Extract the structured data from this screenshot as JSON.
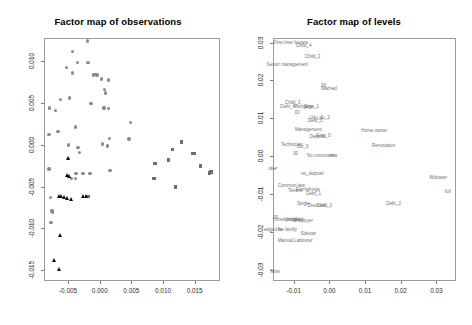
{
  "figure": {
    "background": "#ffffff",
    "panels": [
      {
        "id": "observations",
        "title": "Factor map of observations"
      },
      {
        "id": "levels",
        "title": "Factor map of levels"
      }
    ]
  },
  "chart_data": [
    {
      "type": "scatter",
      "title": "Factor map of observations",
      "xlabel": "",
      "ylabel": "",
      "xlim": [
        -0.0088,
        0.019
      ],
      "ylim": [
        -0.0163,
        0.0128
      ],
      "xticks": [
        "-0.005",
        "0.000",
        "0.005",
        "0.010",
        "0.015"
      ],
      "xtickvals": [
        -0.005,
        0.0,
        0.005,
        0.01,
        0.015
      ],
      "yticks": [
        "0.010",
        "0.005",
        "0.000",
        "-0.005",
        "-0.010",
        "-0.015"
      ],
      "ytickvals": [
        0.01,
        0.005,
        0.0,
        -0.005,
        -0.01,
        -0.015
      ],
      "grid": false,
      "legend": "none",
      "series": [
        {
          "name": "group-circle-gray",
          "marker": "circle",
          "color": "#8a8a8a",
          "points": [
            [
              -0.00195,
              0.01245
            ],
            [
              -0.00425,
              0.01115
            ],
            [
              -0.00355,
              0.00985
            ],
            [
              -0.00185,
              0.00985
            ],
            [
              -0.00525,
              0.0093
            ],
            [
              -0.0043,
              0.0086
            ],
            [
              -0.00095,
              0.00835
            ],
            [
              -0.00075,
              0.0084
            ],
            [
              -0.0006,
              0.00845
            ],
            [
              -0.0004,
              0.00835
            ],
            [
              0.00025,
              0.0079
            ],
            [
              0.0014,
              0.00775
            ],
            [
              0.00075,
              0.0066
            ],
            [
              0.0009,
              0.0062
            ],
            [
              -0.0048,
              0.0056
            ],
            [
              -0.0062,
              0.00545
            ],
            [
              -0.00135,
              0.00495
            ],
            [
              0.00135,
              0.00435
            ],
            [
              0.00065,
              0.0044
            ],
            [
              -0.0079,
              0.0044
            ],
            [
              -0.00695,
              0.0041
            ],
            [
              -0.0038,
              0.00215
            ],
            [
              0.0049,
              0.00265
            ],
            [
              -0.0066,
              0.0016
            ],
            [
              -0.008,
              0.00125
            ],
            [
              0.00045,
              0.0001
            ],
            [
              -0.0049,
              0.0
            ],
            [
              0.0012,
              -0.00015
            ],
            [
              0.0015,
              0.00075
            ],
            [
              0.0046,
              0.0007
            ],
            [
              -0.0034,
              -0.00035
            ],
            [
              -0.0032,
              -0.0009
            ],
            [
              -0.00495,
              -0.00165
            ],
            [
              -0.00155,
              -0.00345
            ],
            [
              -0.00375,
              -0.0034
            ],
            [
              -0.0049,
              -0.00375
            ],
            [
              -0.0045,
              -0.004
            ],
            [
              -0.0038,
              -0.00405
            ],
            [
              0.0016,
              -0.00305
            ],
            [
              -0.00265,
              -0.0034
            ],
            [
              -0.008,
              -0.0029
            ],
            [
              -0.00775,
              -0.0063
            ],
            [
              -0.00755,
              -0.0079
            ],
            [
              -0.0075,
              -0.00805
            ],
            [
              -0.0077,
              -0.0093
            ]
          ]
        },
        {
          "name": "group-square-gray",
          "marker": "square",
          "color": "#6e6e6e",
          "points": [
            [
              0.0129,
              0.00035
            ],
            [
              0.01145,
              -0.00055
            ],
            [
              0.01465,
              -0.00105
            ],
            [
              0.015,
              -0.00105
            ],
            [
              0.0109,
              -0.0018
            ],
            [
              0.00875,
              -0.00225
            ],
            [
              0.0159,
              -0.00255
            ],
            [
              0.0173,
              -0.00335
            ],
            [
              0.0176,
              -0.00325
            ],
            [
              0.00855,
              -0.004
            ],
            [
              0.01195,
              -0.00505
            ],
            [
              -0.00205,
              -0.00615
            ],
            [
              -0.00175,
              -0.0062
            ]
          ]
        },
        {
          "name": "group-triangle-black",
          "marker": "triangle",
          "color": "#111111",
          "points": [
            [
              -0.00485,
              -0.00165
            ],
            [
              -0.005,
              -0.0036
            ],
            [
              -0.0047,
              -0.0038
            ],
            [
              -0.0064,
              -0.00615
            ],
            [
              -0.006,
              -0.0062
            ],
            [
              -0.00555,
              -0.00625
            ],
            [
              -0.0051,
              -0.00645
            ],
            [
              -0.00445,
              -0.00655
            ],
            [
              -0.0025,
              -0.00615
            ],
            [
              -0.00215,
              -0.0061
            ],
            [
              -0.00615,
              -0.01085
            ],
            [
              -0.00715,
              -0.01385
            ],
            [
              -0.0064,
              -0.0149
            ]
          ]
        }
      ]
    },
    {
      "type": "scatter",
      "title": "Factor map of levels",
      "xlabel": "",
      "ylabel": "",
      "xlim": [
        -0.0158,
        0.0355
      ],
      "ylim": [
        -0.033,
        0.0312
      ],
      "xticks": [
        "-0.01",
        "0.00",
        "0.01",
        "0.02",
        "0.03"
      ],
      "xtickvals": [
        -0.01,
        0.0,
        0.01,
        0.02,
        0.03
      ],
      "yticks": [
        "0.03",
        "0.02",
        "0.01",
        "0.00",
        "-0.01",
        "-0.02",
        "-0.03"
      ],
      "ytickvals": [
        0.03,
        0.02,
        0.01,
        0.0,
        -0.01,
        -0.02,
        -0.03
      ],
      "grid": false,
      "legend": "none",
      "labels": [
        {
          "text": "First-time buyers",
          "x": -0.0108,
          "y": 0.03
        },
        {
          "text": "Child_4",
          "x": -0.0072,
          "y": 0.0292
        },
        {
          "text": "Child_2",
          "x": -0.0047,
          "y": 0.0262
        },
        {
          "text": "Senior management",
          "x": -0.0118,
          "y": 0.0241
        },
        {
          "text": "30",
          "x": -0.0016,
          "y": 0.0184
        },
        {
          "text": "Married",
          "x": -0.0001,
          "y": 0.0178
        },
        {
          "text": "Child_3",
          "x": -0.0103,
          "y": 0.014
        },
        {
          "text": "Debt_4",
          "x": -0.0117,
          "y": 0.013
        },
        {
          "text": "Mortgage",
          "x": -0.0072,
          "y": 0.013
        },
        {
          "text": "Emp_1",
          "x": -0.005,
          "y": 0.0129
        },
        {
          "text": "DI",
          "x": -0.009,
          "y": 0.0113
        },
        {
          "text": "Usu_1",
          "x": -0.0036,
          "y": 0.0101
        },
        {
          "text": "ou_2",
          "x": -0.0013,
          "y": 0.01
        },
        {
          "text": "Debt_3",
          "x": -0.004,
          "y": 0.0092
        },
        {
          "text": "Management",
          "x": -0.0059,
          "y": 0.0068
        },
        {
          "text": "Home owner",
          "x": 0.0126,
          "y": 0.0066
        },
        {
          "text": "Deposit",
          "x": -0.0034,
          "y": 0.005
        },
        {
          "text": "Emp_0",
          "x": -0.0016,
          "y": 0.0052
        },
        {
          "text": "Technician",
          "x": -0.0105,
          "y": 0.003
        },
        {
          "text": "Civ_0",
          "x": -0.0075,
          "y": 0.0025
        },
        {
          "text": "Renovation",
          "x": 0.0152,
          "y": 0.0026
        },
        {
          "text": "30",
          "x": -0.0095,
          "y": 0.0005
        },
        {
          "text": "No mountains",
          "x": -0.0023,
          "y": 0.0
        },
        {
          "text": "tins",
          "x": 0.0012,
          "y": 0.0
        },
        {
          "text": "oker",
          "x": -0.0158,
          "y": -0.0034
        },
        {
          "text": "no_deposit",
          "x": -0.0048,
          "y": -0.0046
        },
        {
          "text": "Widower",
          "x": 0.0305,
          "y": -0.0058
        },
        {
          "text": "Common-law",
          "x": -0.0107,
          "y": -0.008
        },
        {
          "text": "Tenant",
          "x": -0.0096,
          "y": -0.0092
        },
        {
          "text": "Furnishings",
          "x": -0.006,
          "y": -0.0089
        },
        {
          "text": "Debt_1",
          "x": -0.0044,
          "y": -0.01
        },
        {
          "text": "full",
          "x": 0.0332,
          "y": -0.0094
        },
        {
          "text": "Divorced",
          "x": -0.0036,
          "y": -0.0131
        },
        {
          "text": "Child_0",
          "x": -0.0014,
          "y": -0.0133
        },
        {
          "text": "Debt_2",
          "x": 0.018,
          "y": -0.0127
        },
        {
          "text": "Single",
          "x": -0.0073,
          "y": -0.0126
        },
        {
          "text": "20",
          "x": -0.0151,
          "y": -0.0164
        },
        {
          "text": "Unemployed",
          "x": -0.0118,
          "y": -0.017
        },
        {
          "text": "Unskilled",
          "x": -0.01,
          "y": -0.017
        },
        {
          "text": "Employer",
          "x": -0.0073,
          "y": -0.0172
        },
        {
          "text": "edged to",
          "x": -0.0158,
          "y": -0.0196
        },
        {
          "text": "the family",
          "x": -0.0118,
          "y": -0.0196
        },
        {
          "text": "Sidecar",
          "x": -0.0059,
          "y": -0.0207
        },
        {
          "text": "Manual Labourer",
          "x": -0.0096,
          "y": -0.0224
        },
        {
          "text": "Miss",
          "x": -0.0152,
          "y": -0.0305
        }
      ]
    }
  ]
}
